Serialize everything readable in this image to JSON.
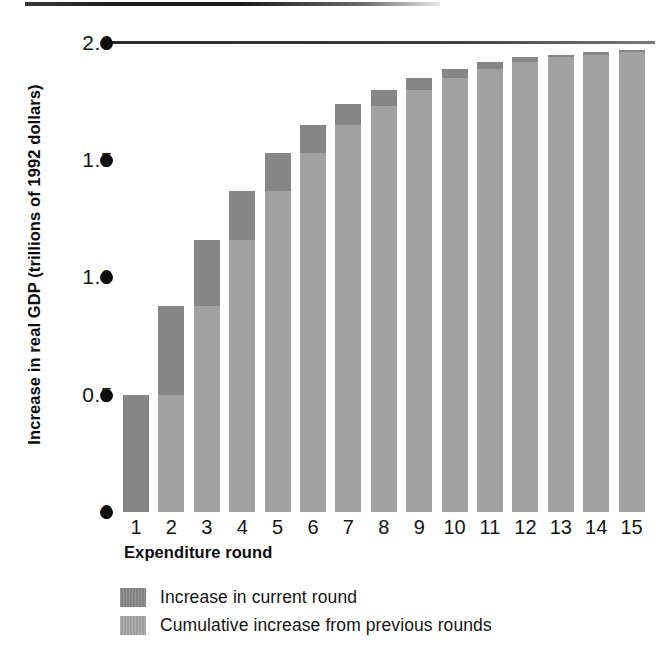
{
  "chart_data": {
    "type": "bar",
    "stacked": true,
    "title": "",
    "xlabel": "Expenditure round",
    "ylabel": "Increase in real GDP (trillions of 1992 dollars)",
    "categories": [
      "1",
      "2",
      "3",
      "4",
      "5",
      "6",
      "7",
      "8",
      "9",
      "10",
      "11",
      "12",
      "13",
      "14",
      "15"
    ],
    "ylim": [
      0,
      2.0
    ],
    "ytick_values": [
      2.0,
      1.5,
      1.0,
      0.5,
      0
    ],
    "ytick_labels": [
      "2.0",
      "1.5",
      "1.0",
      "0.5",
      "0"
    ],
    "grid": false,
    "legend_position": "below-plot",
    "series": [
      {
        "name": "Cumulative increase from previous rounds",
        "color": "#a2a2a2",
        "values": [
          0.0,
          0.5,
          0.88,
          1.16,
          1.37,
          1.53,
          1.65,
          1.73,
          1.8,
          1.85,
          1.89,
          1.92,
          1.94,
          1.95,
          1.96
        ]
      },
      {
        "name": "Increase in current round",
        "color": "#868686",
        "values": [
          0.5,
          0.38,
          0.28,
          0.21,
          0.16,
          0.12,
          0.09,
          0.07,
          0.05,
          0.04,
          0.03,
          0.02,
          0.01,
          0.01,
          0.01
        ]
      }
    ],
    "totals": [
      0.5,
      0.88,
      1.16,
      1.37,
      1.53,
      1.65,
      1.73,
      1.8,
      1.85,
      1.89,
      1.92,
      1.94,
      1.95,
      1.96,
      1.97
    ],
    "reference_line": {
      "value": 2.0,
      "label": "",
      "color": "#2b2b2b"
    },
    "annotations": []
  },
  "axes": {
    "y_title": "Increase in real GDP (trillions of 1992 dollars)",
    "x_title": "Expenditure round",
    "y_ticks": [
      "2.0",
      "1.5",
      "1.0",
      "0.5",
      "0"
    ],
    "x_ticks": [
      "1",
      "2",
      "3",
      "4",
      "5",
      "6",
      "7",
      "8",
      "9",
      "10",
      "11",
      "12",
      "13",
      "14",
      "15"
    ]
  },
  "legend": {
    "items": [
      {
        "label": "Increase in current round",
        "color": "#868686",
        "swatch": "current-round-swatch"
      },
      {
        "label": "Cumulative increase from previous rounds",
        "color": "#a2a2a2",
        "swatch": "previous-rounds-swatch"
      }
    ]
  },
  "colors": {
    "current_round": "#868686",
    "previous_rounds": "#a2a2a2",
    "axis": "#0d0d0d",
    "background": "#ffffff"
  }
}
